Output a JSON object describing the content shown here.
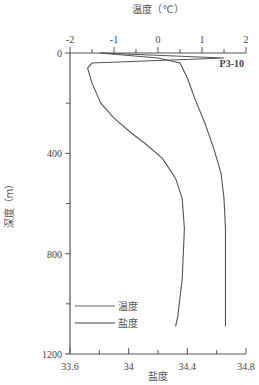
{
  "chart_data": {
    "type": "line",
    "title": "",
    "station_label": "P3-10",
    "top_axis": {
      "label": "温度（℃）",
      "ticks": [
        "-2",
        "-1",
        "0",
        "1",
        "2"
      ],
      "range": [
        -2,
        2
      ]
    },
    "bottom_axis": {
      "label": "盐度",
      "ticks": [
        "33.6",
        "34",
        "34.4",
        "34.8"
      ],
      "range": [
        33.6,
        34.8
      ]
    },
    "y_axis": {
      "label": "深度（m）",
      "ticks": [
        "0",
        "400",
        "800",
        "1200"
      ],
      "range": [
        0,
        1200
      ],
      "inverted": true
    },
    "legend": [
      {
        "name": "温度"
      },
      {
        "name": "盐度"
      }
    ],
    "series": [
      {
        "name": "温度",
        "axis": "top",
        "points": [
          [
            -1.3,
            0
          ],
          [
            1.5,
            20
          ],
          [
            -1.5,
            40
          ],
          [
            -1.6,
            60
          ],
          [
            -1.5,
            120
          ],
          [
            -1.4,
            160
          ],
          [
            -1.3,
            200
          ],
          [
            -1.0,
            260
          ],
          [
            -0.6,
            320
          ],
          [
            -0.3,
            360
          ],
          [
            0.1,
            420
          ],
          [
            0.4,
            500
          ],
          [
            0.55,
            580
          ],
          [
            0.6,
            700
          ],
          [
            0.55,
            900
          ],
          [
            0.45,
            1050
          ],
          [
            0.4,
            1090
          ]
        ]
      },
      {
        "name": "盐度",
        "axis": "bottom",
        "points": [
          [
            33.8,
            0
          ],
          [
            34.2,
            20
          ],
          [
            34.35,
            40
          ],
          [
            34.4,
            100
          ],
          [
            34.45,
            180
          ],
          [
            34.52,
            280
          ],
          [
            34.58,
            380
          ],
          [
            34.63,
            480
          ],
          [
            34.65,
            580
          ],
          [
            34.66,
            700
          ],
          [
            34.66,
            900
          ],
          [
            34.66,
            1090
          ]
        ]
      }
    ]
  }
}
